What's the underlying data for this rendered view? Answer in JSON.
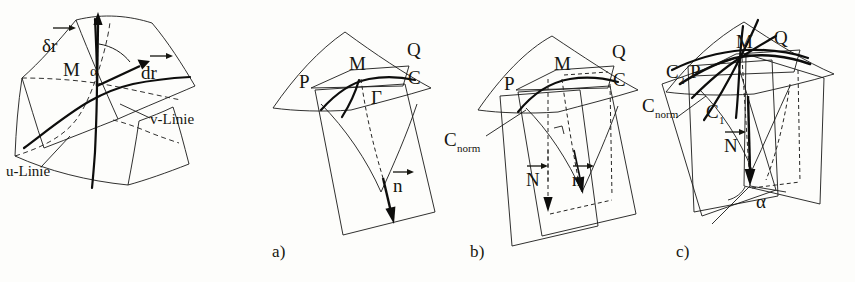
{
  "figure": {
    "background_color": "#fdfdfb",
    "ink_color": "#15150f",
    "panel_count": 4
  },
  "panel_0": {
    "caption": "",
    "labels": {
      "delta_r": "δr",
      "d_r": "dr",
      "point_M": "M",
      "angle": "α",
      "u_line": "u-Linie",
      "v_line": "v-Linie"
    }
  },
  "panel_a": {
    "caption": "a)",
    "labels": {
      "point_P": "P",
      "point_M": "M",
      "point_Q": "Q",
      "point_C": "C",
      "curve_gamma": "Γ",
      "normal_vector": "n"
    }
  },
  "panel_b": {
    "caption": "b)",
    "labels": {
      "point_P": "P",
      "point_M": "M",
      "point_Q": "Q",
      "point_C": "C",
      "c_norm": "C",
      "c_norm_sub": "norm",
      "vector_N": "N",
      "vector_n": "n"
    }
  },
  "panel_c": {
    "caption": "c)",
    "labels": {
      "point_M": "M",
      "point_Q": "Q",
      "point_P": "P",
      "c_two": "C",
      "c_two_sub": "2",
      "c_one": "C",
      "c_one_sub": "1",
      "c_norm": "C",
      "c_norm_sub": "norm",
      "vector_N": "N",
      "angle": "α"
    }
  }
}
